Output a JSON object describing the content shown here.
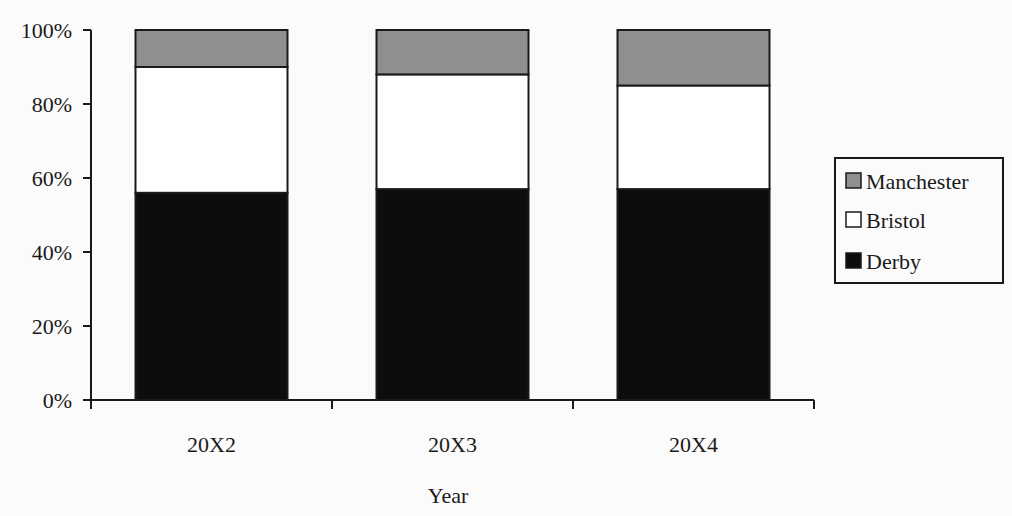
{
  "chart_data": {
    "type": "bar",
    "stacked": true,
    "percent_stacked": true,
    "title": "",
    "xlabel": "Year",
    "ylabel": "",
    "categories": [
      "20X2",
      "20X3",
      "20X4"
    ],
    "series": [
      {
        "name": "Derby",
        "values": [
          56,
          57,
          57
        ],
        "color": "#0d0d0d"
      },
      {
        "name": "Bristol",
        "values": [
          34,
          31,
          28
        ],
        "color": "#ffffff"
      },
      {
        "name": "Manchester",
        "values": [
          10,
          12,
          15
        ],
        "color": "#8f8f8f"
      }
    ],
    "ylim": [
      0,
      100
    ],
    "yticks": [
      "0%",
      "20%",
      "40%",
      "60%",
      "80%",
      "100%"
    ],
    "grid": false,
    "legend": {
      "position": "right",
      "entries": [
        "Manchester",
        "Bristol",
        "Derby"
      ]
    }
  }
}
